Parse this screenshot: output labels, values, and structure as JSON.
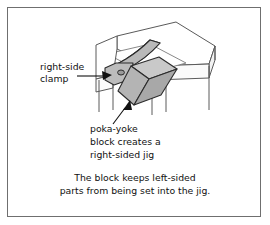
{
  "figure": {
    "type": "technical-illustration",
    "border_color": "#6f6f6f",
    "background_color": "#ffffff"
  },
  "annotations": [
    {
      "id": "right-side-clamp",
      "lines": [
        "right-side",
        "clamp"
      ],
      "line1": "right-side",
      "line2": "clamp",
      "leader": "arrow pointing right into the clamp arm"
    },
    {
      "id": "poka-yoke-block",
      "lines": [
        "poka-yoke",
        "block creates a",
        "right-sided jig"
      ],
      "line1": "poka-yoke",
      "line2": "block creates a",
      "line3": "right-sided jig",
      "leader": "arrow pointing up-right into the block"
    }
  ],
  "caption": {
    "line1": "The block keeps left-sided",
    "line2": "parts from being set into the jig."
  },
  "drawing": {
    "parts": [
      {
        "name": "jig-table",
        "fill": "#ffffff",
        "stroke": "#5a5a5a"
      },
      {
        "name": "clamp-arm",
        "fill": "#b9b9b9",
        "stroke": "#2b2b2b"
      },
      {
        "name": "clamp-pivot-hole",
        "fill": "#9a9a9a",
        "stroke": "#2b2b2b"
      },
      {
        "name": "poka-yoke-block",
        "fill": "#bdbdbd",
        "stroke": "#2b2b2b"
      }
    ],
    "colors": {
      "outline_dark": "#2b2b2b",
      "outline_light": "#5a5a5a",
      "gray_top": "#c9c9c9",
      "gray_front": "#b4b4b4",
      "gray_side": "#a4a4a4",
      "text": "#111111"
    }
  }
}
